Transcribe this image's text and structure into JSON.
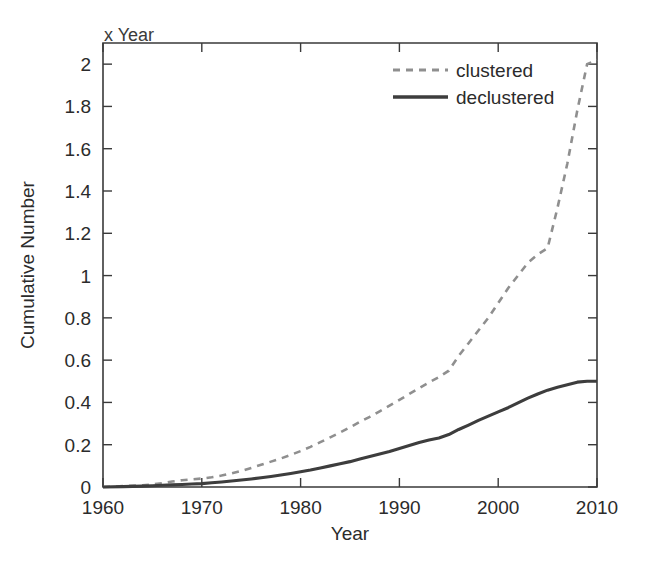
{
  "figure": {
    "corner_note": "x Year",
    "background": "#ffffff"
  },
  "chart_data": {
    "type": "line",
    "title": "",
    "xlabel": "Year",
    "ylabel": "Cumulative Number",
    "xlim": [
      1960,
      2010
    ],
    "ylim": [
      0,
      2.1
    ],
    "xticks": [
      1960,
      1970,
      1980,
      1990,
      2000,
      2010
    ],
    "xtick_labels": [
      "1960",
      "1970",
      "1980",
      "1990",
      "2000",
      "2010"
    ],
    "yticks": [
      0,
      0.2,
      0.4,
      0.6,
      0.8,
      1,
      1.2,
      1.4,
      1.6,
      1.8,
      2
    ],
    "ytick_labels": [
      "0",
      "0.2",
      "0.4",
      "0.6",
      "0.8",
      "1",
      "1.2",
      "1.4",
      "1.6",
      "1.8",
      "2"
    ],
    "grid": false,
    "legend_position": "top-center",
    "colors": {
      "clustered": "#8f8f8f",
      "declustered": "#3d3d3d",
      "axis": "#3a3a3a",
      "text": "#2b2b2b"
    },
    "series": [
      {
        "name": "clustered",
        "style": "dashed",
        "color": "#8f8f8f",
        "x": [
          1960,
          1962,
          1964,
          1965,
          1966,
          1967,
          1968,
          1969,
          1970,
          1971,
          1972,
          1973,
          1974,
          1975,
          1976,
          1977,
          1978,
          1979,
          1980,
          1981,
          1982,
          1983,
          1984,
          1985,
          1986,
          1987,
          1988,
          1989,
          1990,
          1991,
          1992,
          1993,
          1994,
          1995,
          1996,
          1997,
          1998,
          1999,
          2000,
          2001,
          2002,
          2003,
          2004,
          2005,
          2006,
          2007,
          2008,
          2009,
          2010
        ],
        "values": [
          0.0,
          0.004,
          0.008,
          0.012,
          0.018,
          0.026,
          0.032,
          0.036,
          0.04,
          0.046,
          0.054,
          0.064,
          0.076,
          0.09,
          0.105,
          0.12,
          0.135,
          0.152,
          0.17,
          0.19,
          0.212,
          0.235,
          0.258,
          0.282,
          0.308,
          0.332,
          0.358,
          0.385,
          0.412,
          0.44,
          0.468,
          0.495,
          0.52,
          0.55,
          0.62,
          0.68,
          0.74,
          0.8,
          0.87,
          0.94,
          1.0,
          1.06,
          1.1,
          1.13,
          1.32,
          1.53,
          1.78,
          2.0,
          2.02
        ]
      },
      {
        "name": "declustered",
        "style": "solid",
        "color": "#3d3d3d",
        "x": [
          1960,
          1962,
          1964,
          1965,
          1966,
          1967,
          1968,
          1969,
          1970,
          1971,
          1972,
          1973,
          1974,
          1975,
          1976,
          1977,
          1978,
          1979,
          1980,
          1981,
          1982,
          1983,
          1984,
          1985,
          1986,
          1987,
          1988,
          1989,
          1990,
          1991,
          1992,
          1993,
          1994,
          1995,
          1996,
          1997,
          1998,
          1999,
          2000,
          2001,
          2002,
          2003,
          2004,
          2005,
          2006,
          2007,
          2008,
          2009,
          2010
        ],
        "values": [
          0.0,
          0.002,
          0.004,
          0.006,
          0.008,
          0.01,
          0.012,
          0.014,
          0.016,
          0.02,
          0.024,
          0.028,
          0.033,
          0.038,
          0.044,
          0.05,
          0.057,
          0.064,
          0.072,
          0.08,
          0.09,
          0.1,
          0.11,
          0.12,
          0.132,
          0.144,
          0.156,
          0.168,
          0.182,
          0.196,
          0.21,
          0.222,
          0.232,
          0.248,
          0.272,
          0.293,
          0.315,
          0.335,
          0.355,
          0.375,
          0.398,
          0.42,
          0.44,
          0.458,
          0.472,
          0.484,
          0.496,
          0.5,
          0.5
        ]
      }
    ],
    "legend": [
      {
        "label": "clustered",
        "style": "dashed",
        "color": "#8f8f8f"
      },
      {
        "label": "declustered",
        "style": "solid",
        "color": "#3d3d3d"
      }
    ]
  }
}
